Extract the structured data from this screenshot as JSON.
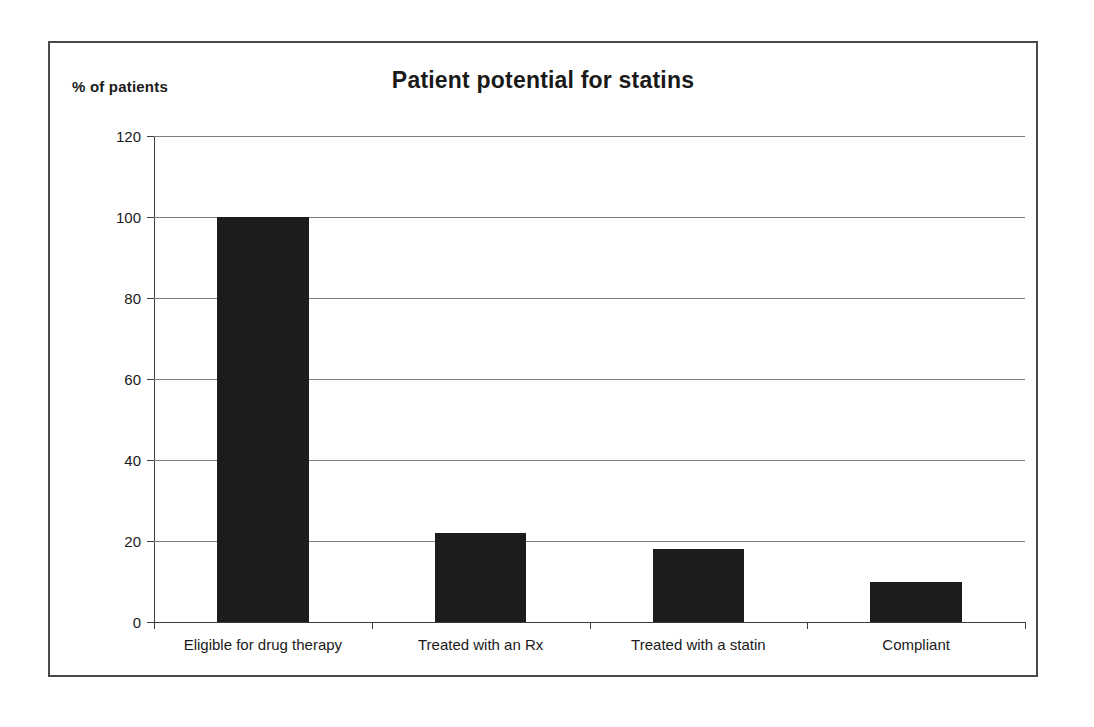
{
  "figure": {
    "title": "Patient potential for statins",
    "y_axis_caption": "% of patients",
    "frame_color": "#4a4a4a",
    "bar_color": "#1c1c1c",
    "gridline_color": "#7d7d7d",
    "axis_color": "#3d3d3d",
    "background": "#ffffff"
  },
  "chart_data": {
    "type": "bar",
    "title": "Patient potential for statins",
    "xlabel": "",
    "ylabel": "% of patients",
    "ylim": [
      0,
      120
    ],
    "yticks": [
      0,
      20,
      40,
      60,
      80,
      100,
      120
    ],
    "ytick_labels": [
      "0",
      "20",
      "40",
      "60",
      "80",
      "100",
      "120"
    ],
    "grid": true,
    "grid_axis": "y",
    "legend": false,
    "legend_position": "none",
    "categories": [
      "Eligible for drug therapy",
      "Treated with an Rx",
      "Treated with a statin",
      "Compliant"
    ],
    "values": [
      100,
      22,
      18,
      10
    ],
    "series": [
      {
        "name": "% of patients",
        "color": "#1c1c1c",
        "values": [
          100,
          22,
          18,
          10
        ]
      }
    ]
  }
}
